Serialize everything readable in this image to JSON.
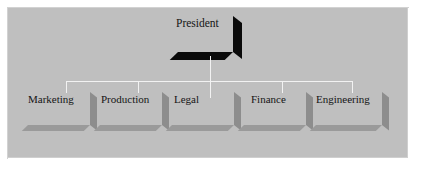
{
  "diagram": {
    "type": "org-chart",
    "title_node": {
      "label": "President",
      "shadow_color": "#0a0a0a"
    },
    "background_color": "#bfbfbf",
    "frame_color": "#ffffff",
    "connector_color": "#f2f2f2",
    "department_shadow_color": "#8d8d8d",
    "departments": [
      {
        "label": "Marketing"
      },
      {
        "label": "Production"
      },
      {
        "label": "Legal"
      },
      {
        "label": "Finance"
      },
      {
        "label": "Engineering"
      }
    ]
  }
}
